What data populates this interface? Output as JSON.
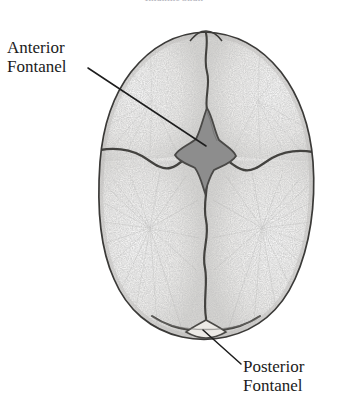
{
  "figure": {
    "caption": "Infantile Skull",
    "view": "superior view of infant skull"
  },
  "annotations": [
    {
      "id": "anterior-fontanel",
      "line1": "Anterior",
      "line2": "Fontanel",
      "leader": {
        "x1": 88,
        "y1": 68,
        "x2": 206,
        "y2": 146
      }
    },
    {
      "id": "posterior-fontanel",
      "line1": "Posterior",
      "line2": "Fontanel",
      "leader": {
        "x1": 241,
        "y1": 364,
        "x2": 203,
        "y2": 330
      }
    }
  ],
  "colors": {
    "background": "#ffffff",
    "bone_fill": "#f2f1ef",
    "bone_stipple": "#8d8d8d",
    "outline": "#3b3a38",
    "suture": "#43423f",
    "fontanel_fill": "#8d8d8d",
    "fontanel_edge": "#4a4947",
    "leader_line": "#1d1d1d",
    "label_text": "#1b1b1b",
    "caption_text": "#b9b9c2"
  },
  "structures": {
    "anterior_fontanel_label": "Anterior Fontanel",
    "posterior_fontanel_label": "Posterior Fontanel",
    "sagittal_suture": "sagittal suture",
    "coronal_suture": "coronal suture",
    "metopic_suture": "metopic suture",
    "lambdoid_suture": "lambdoid suture",
    "frontal_bone_left": "left frontal bone",
    "frontal_bone_right": "right frontal bone",
    "parietal_bone_left": "left parietal bone",
    "parietal_bone_right": "right parietal bone"
  }
}
